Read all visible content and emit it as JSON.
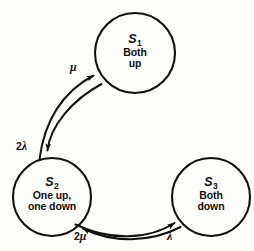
{
  "diagram": {
    "type": "state-transition",
    "background_color": "#fdfdfc",
    "stroke_color": "#111111",
    "states": [
      {
        "id": "S1",
        "name": "S",
        "subscript": "1",
        "description_line1": "Both",
        "description_line2": "up",
        "cx": 135,
        "cy": 53,
        "r": 40
      },
      {
        "id": "S2",
        "name": "S",
        "subscript": "2",
        "description_line1": "One up,",
        "description_line2": "one down",
        "cx": 52,
        "cy": 197,
        "r": 39
      },
      {
        "id": "S3",
        "name": "S",
        "subscript": "3",
        "description_line1": "Both",
        "description_line2": "down",
        "cx": 211,
        "cy": 197,
        "r": 39
      }
    ],
    "transitions": [
      {
        "id": "s2-to-s1",
        "from": "S2",
        "to": "S1",
        "label_coefficient": "",
        "label_symbol": "μ",
        "label_text": "μ"
      },
      {
        "id": "s1-to-s2",
        "from": "S1",
        "to": "S2",
        "label_coefficient": "2",
        "label_symbol": "λ",
        "label_text": "2λ"
      },
      {
        "id": "s3-to-s2",
        "from": "S3",
        "to": "S2",
        "label_coefficient": "2",
        "label_symbol": "μ",
        "label_text": "2μ"
      },
      {
        "id": "s2-to-s3",
        "from": "S2",
        "to": "S3",
        "label_coefficient": "",
        "label_symbol": "λ",
        "label_text": "λ"
      }
    ]
  }
}
